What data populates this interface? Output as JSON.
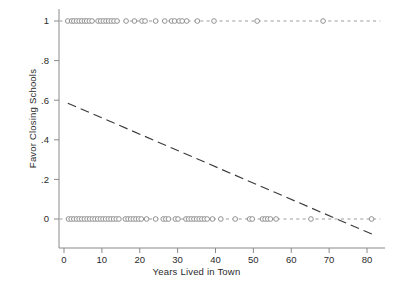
{
  "chart_data": {
    "type": "scatter",
    "title": "",
    "xlabel": "Years Lived in Town",
    "ylabel": "Favor Closing Schools",
    "xlim": [
      -2,
      84
    ],
    "ylim": [
      -0.12,
      1.08
    ],
    "grid": false,
    "legend": null,
    "xticks": [
      0,
      10,
      20,
      30,
      40,
      50,
      60,
      70,
      80
    ],
    "xticklabels": [
      "0",
      "10",
      "20",
      "30",
      "40",
      "50",
      "60",
      "70",
      "80"
    ],
    "yticks": [
      0,
      0.2,
      0.4,
      0.6,
      0.8,
      1
    ],
    "yticklabels": [
      "0",
      ".2",
      ".4",
      ".6",
      ".8",
      "1"
    ],
    "marker": "open-circle",
    "marker_color": "#8c8c8c",
    "series": [
      {
        "name": "Favor Closing Schools = 1",
        "y": 1,
        "x": [
          1,
          2,
          2.6,
          3.3,
          4,
          4.7,
          5.4,
          6,
          6.7,
          7.4,
          9,
          9.7,
          10.4,
          11.1,
          11.8,
          12.5,
          13.2,
          14,
          16.4,
          18.6,
          20.6,
          21.4,
          24.2,
          26.6,
          28.4,
          29.2,
          30.4,
          31.2,
          32.4,
          35.2,
          39.6,
          51,
          68.4
        ]
      },
      {
        "name": "Favor Closing Schools = 0",
        "y": 0,
        "x": [
          1.2,
          1.9,
          2.6,
          3.3,
          4,
          4.7,
          5.4,
          6.1,
          6.8,
          7.5,
          8.2,
          8.9,
          9.6,
          10.3,
          11,
          11.7,
          12.4,
          13.1,
          13.8,
          14.5,
          16.2,
          16.9,
          17.6,
          18.3,
          19,
          19.7,
          20.4,
          21.8,
          24.2,
          26.2,
          26.9,
          27.6,
          29.4,
          30.1,
          32.2,
          32.9,
          33.6,
          34.3,
          35,
          35.7,
          36.4,
          37.1,
          37.8,
          39.2,
          41.4,
          45.2,
          49,
          49.7,
          52.4,
          53.1,
          53.8,
          54.5,
          56,
          65.2,
          81.2
        ]
      }
    ],
    "fit_line": {
      "name": "linear prediction",
      "style": "dashed",
      "color": "#3a3a3a",
      "x_start": 1.0,
      "y_start": 0.585,
      "x_end": 81.5,
      "y_end": -0.078,
      "slope": -0.00824,
      "intercept": 0.593,
      "x_intercept": 72.0
    },
    "reference_lines": [
      {
        "y": 1,
        "style": "dashed",
        "color": "#9a9a9a"
      },
      {
        "y": 0,
        "style": "dashed",
        "color": "#9a9a9a"
      }
    ]
  }
}
